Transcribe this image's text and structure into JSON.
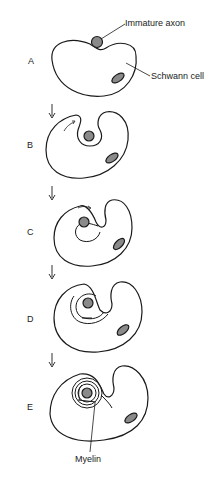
{
  "diagram": {
    "type": "biological-process",
    "stages": [
      {
        "id": "A",
        "label": "A"
      },
      {
        "id": "B",
        "label": "B"
      },
      {
        "id": "C",
        "label": "C"
      },
      {
        "id": "D",
        "label": "D"
      },
      {
        "id": "E",
        "label": "E"
      }
    ],
    "annotations": {
      "axon": "Immature axon",
      "schwann": "Schwann cell",
      "myelin": "Myelin"
    },
    "colors": {
      "stroke": "#1a1a1a",
      "nucleus_fill": "#8a8a8a",
      "axon_fill": "#8a8a8a",
      "background": "#ffffff"
    }
  }
}
